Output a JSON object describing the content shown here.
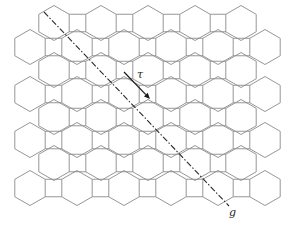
{
  "diagram": {
    "title": "",
    "stroke_color": "#8a8a8a",
    "line_color": "#1a1a1a",
    "hexagon": {
      "circumradius": 17.5,
      "orientation": "pointy-top"
    },
    "rows": [
      {
        "type": "A",
        "y": 23,
        "x": [
          54,
          101,
          148,
          195,
          241
        ]
      },
      {
        "type": "B",
        "y": 47,
        "x": [
          30,
          77,
          124,
          171,
          218,
          265
        ]
      },
      {
        "type": "A",
        "y": 70,
        "x": [
          54,
          101,
          148,
          195,
          241
        ]
      },
      {
        "type": "B",
        "y": 94,
        "x": [
          30,
          77,
          124,
          171,
          218,
          265
        ]
      },
      {
        "type": "A",
        "y": 117,
        "x": [
          54,
          101,
          148,
          195,
          241
        ]
      },
      {
        "type": "B",
        "y": 140,
        "x": [
          30,
          77,
          124,
          171,
          218,
          265
        ]
      },
      {
        "type": "A",
        "y": 163,
        "x": [
          54,
          101,
          148,
          195,
          241
        ]
      },
      {
        "type": "B",
        "y": 188,
        "x": [
          30,
          77,
          124,
          171,
          218,
          265
        ]
      }
    ],
    "glide_axis": {
      "label": "g",
      "x1": 44,
      "y1": 12,
      "x2": 229,
      "y2": 206,
      "label_x": 229,
      "label_y": 207,
      "style": "dash-dot"
    },
    "translation": {
      "label": "τ",
      "x1": 124,
      "y1": 72,
      "x2": 150,
      "y2": 99,
      "label_x": 137,
      "label_y": 69
    }
  }
}
